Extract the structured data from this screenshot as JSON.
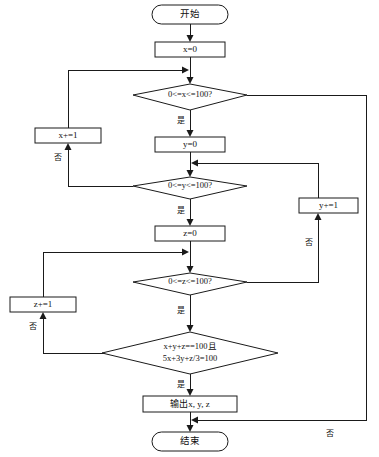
{
  "diagram": {
    "type": "flowchart",
    "orientation": "top-to-bottom",
    "nodes": {
      "start": {
        "label": "开始",
        "shape": "terminator"
      },
      "init_x": {
        "label": "x=0",
        "shape": "process"
      },
      "cond_x": {
        "label": "0<=x<=100?",
        "shape": "decision"
      },
      "inc_x": {
        "label": "x+=1",
        "shape": "process"
      },
      "init_y": {
        "label": "y=0",
        "shape": "process"
      },
      "cond_y": {
        "label": "0<=y<=100?",
        "shape": "decision"
      },
      "inc_y": {
        "label": "y+=1",
        "shape": "process"
      },
      "init_z": {
        "label": "z=0",
        "shape": "process"
      },
      "cond_z": {
        "label": "0<=z<=100?",
        "shape": "decision"
      },
      "inc_z": {
        "label": "z+=1",
        "shape": "process"
      },
      "cond_eq_line1": {
        "label": "x+y+z==100且",
        "shape": "decision"
      },
      "cond_eq_line2": {
        "label": "5x+3y+z/3=100",
        "shape": "decision"
      },
      "output": {
        "label": "输出x, y, z",
        "shape": "process"
      },
      "end": {
        "label": "结束",
        "shape": "terminator"
      }
    },
    "edge_labels": {
      "yes_x": "是",
      "no_x": "否",
      "yes_y": "是",
      "no_y": "否",
      "yes_z": "是",
      "no_z": "否",
      "yes_eq": "是",
      "no_eq": "否"
    },
    "colors": {
      "stroke": "#1a1a1a",
      "fill": "#ffffff",
      "text": "#111111"
    }
  }
}
